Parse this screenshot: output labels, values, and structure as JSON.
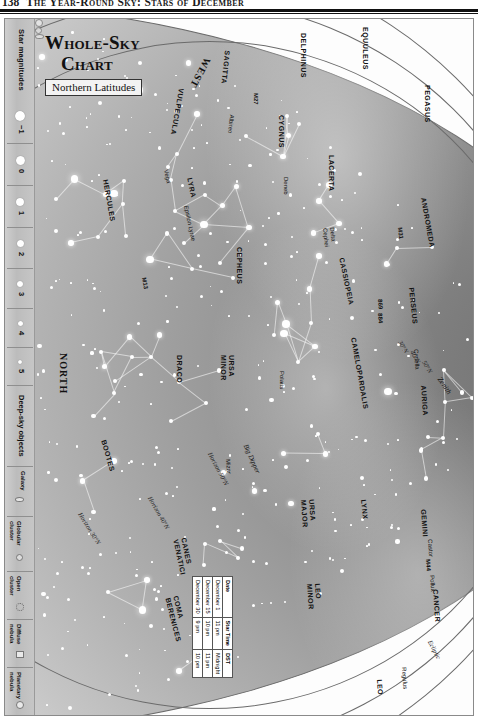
{
  "running_head": {
    "page_number": "138",
    "text": "The Year-Round Sky: Stars of December"
  },
  "title": {
    "line1": "Whole-Sky",
    "line2": "Chart",
    "subtitle": "Northern Latitudes"
  },
  "legend": {
    "star_magnitudes": {
      "title": "Star magnitudes",
      "entries": [
        {
          "label": "−1",
          "size": 9
        },
        {
          "label": "0",
          "size": 8
        },
        {
          "label": "1",
          "size": 7
        },
        {
          "label": "2",
          "size": 6
        },
        {
          "label": "3",
          "size": 5
        },
        {
          "label": "4",
          "size": 4
        },
        {
          "label": "5",
          "size": 3
        }
      ]
    },
    "deep_sky_objects": {
      "title": "Deep-sky objects",
      "entries": [
        {
          "label": "Galaxy",
          "symbol": "galaxy"
        },
        {
          "label": "Globular\ncluster",
          "symbol": "globular-cluster"
        },
        {
          "label": "Open\ncluster",
          "symbol": "open-cluster"
        },
        {
          "label": "Diffuse\nnebula",
          "symbol": "diffuse-nebula"
        },
        {
          "label": "Planetary\nnebula",
          "symbol": "planetary-nebula"
        }
      ]
    }
  },
  "cardinals": [
    {
      "name": "west",
      "label": "WEST"
    },
    {
      "name": "north",
      "label": "NORTH"
    },
    {
      "name": "east",
      "label": "EAST"
    },
    {
      "name": "zenith",
      "label": "Zenith"
    }
  ],
  "horizon_labels": [
    {
      "name": "horizon-30n",
      "label": "Horizon 30°N"
    },
    {
      "name": "horizon-40n",
      "label": "Horizon 40°N"
    },
    {
      "name": "horizon-50n",
      "label": "Horizon 50°N"
    }
  ],
  "latitude_marks": [
    {
      "label": "30°N"
    },
    {
      "label": "40°N"
    },
    {
      "label": "50°N"
    }
  ],
  "ecliptic_label": "Ecliptic",
  "asterisms": [
    {
      "label": "Big Dipper"
    }
  ],
  "constellations": [
    "VULPECULA",
    "SAGITTA",
    "DELPHINUS",
    "EQUULEUS",
    "PEGASUS",
    "LACERTA",
    "CYGNUS",
    "LYRA",
    "HERCULES",
    "CEPHEUS",
    "CASSIOPEIA",
    "ANDROMEDA",
    "PERSEUS",
    "CAMELOPARDALIS",
    "AURIGA",
    "DRACO",
    "URSA MINOR",
    "URSA MAJOR",
    "LYNX",
    "GEMINI",
    "CANCER",
    "LEO",
    "LEO MINOR",
    "BOOTES",
    "CANES VENATICI",
    "COMA BERENICES"
  ],
  "star_names": [
    "Albireo",
    "Vega",
    "Epsilon Lyrae",
    "Deneb",
    "Delta Cephei",
    "Polaris",
    "Mizar",
    "Capella",
    "Castor",
    "Pollux",
    "Regulus"
  ],
  "deep_sky_markers": [
    "M27",
    "M13",
    "M31",
    "869",
    "884",
    "M44"
  ],
  "date_table": {
    "headers": [
      "Date",
      "Star Time",
      "DST"
    ],
    "rows": [
      [
        "December 1",
        "11 pm",
        "Midnight"
      ],
      [
        "December 15",
        "10 pm",
        "11 pm"
      ],
      [
        "December 30",
        "9 pm",
        "10 pm"
      ]
    ]
  }
}
